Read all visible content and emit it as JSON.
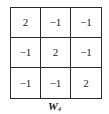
{
  "kernel": {
    "rows": [
      [
        "2",
        "−1",
        "−1"
      ],
      [
        "−1",
        "2",
        "−1"
      ],
      [
        "−1",
        "−1",
        "2"
      ]
    ]
  },
  "caption": {
    "main": "W",
    "subscript": "4"
  },
  "colors": {
    "border": "#2a2a2a",
    "text": "#1a1a1a",
    "background": "#ffffff"
  }
}
